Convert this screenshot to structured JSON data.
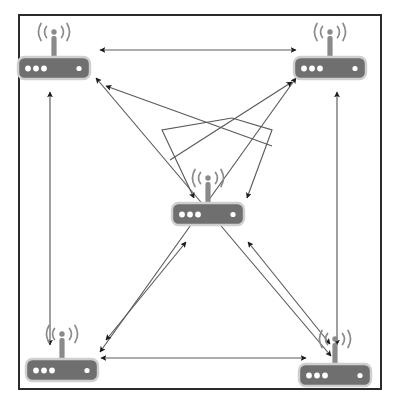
{
  "diagram": {
    "type": "network-topology",
    "canvas": {
      "width": 398,
      "height": 408
    },
    "frame": {
      "name": "coverage-area-boundary",
      "x": 18,
      "y": 14,
      "width": 364,
      "height": 376,
      "stroke": "#2b2b2b",
      "stroke_width": 2,
      "fill": "#ffffff"
    },
    "colors": {
      "device_body": "#6f6f6f",
      "device_outline": "#cfcfcf",
      "device_led": "#ffffff",
      "antenna": "#8a8a8a",
      "link_line": "#5a5a5a",
      "arrowhead": "#1c1c1c",
      "frame_border": "#2b2b2b",
      "background": "#ffffff"
    },
    "node_count": 5,
    "link_count": 12
  },
  "nodes": [
    {
      "id": "router-top-left",
      "label": "Wireless Router",
      "position_label": "top-left",
      "icon": "wireless-router-icon",
      "x": 54,
      "y": 68,
      "body_width": 72,
      "body_height": 22,
      "led_count_left": 3,
      "led_count_right": 1
    },
    {
      "id": "router-top-right",
      "label": "Wireless Router",
      "position_label": "top-right",
      "icon": "wireless-router-icon",
      "x": 330,
      "y": 68,
      "body_width": 72,
      "body_height": 22,
      "led_count_left": 3,
      "led_count_right": 1
    },
    {
      "id": "router-center",
      "label": "Wireless Router",
      "position_label": "center",
      "icon": "wireless-router-icon",
      "x": 208,
      "y": 214,
      "body_width": 72,
      "body_height": 22,
      "led_count_left": 3,
      "led_count_right": 1
    },
    {
      "id": "router-bottom-left",
      "label": "Wireless Router",
      "position_label": "bottom-left",
      "icon": "wireless-router-icon",
      "x": 62,
      "y": 370,
      "body_width": 72,
      "body_height": 22,
      "led_count_left": 3,
      "led_count_right": 1
    },
    {
      "id": "router-bottom-right",
      "label": "Wireless Router",
      "position_label": "bottom-right",
      "icon": "wireless-router-icon",
      "x": 335,
      "y": 375,
      "body_width": 72,
      "body_height": 22,
      "led_count_left": 3,
      "led_count_right": 1
    }
  ],
  "links": [
    {
      "id": "link-top-edge",
      "from": "router-top-left",
      "to": "router-top-right",
      "direction": "bidirectional",
      "shape": "straight",
      "points": "100,50 296,50"
    },
    {
      "id": "link-left-edge",
      "from": "router-top-left",
      "to": "router-bottom-left",
      "direction": "bidirectional",
      "shape": "straight",
      "points": "50,92 50,345"
    },
    {
      "id": "link-right-edge",
      "from": "router-top-right",
      "to": "router-bottom-right",
      "direction": "bidirectional",
      "shape": "straight",
      "points": "337,92 337,345"
    },
    {
      "id": "link-bottom-edge",
      "from": "router-bottom-left",
      "to": "router-bottom-right",
      "direction": "bidirectional",
      "shape": "straight",
      "points": "101,358 306,358"
    },
    {
      "id": "link-diagonal-tl-br",
      "from": "router-top-left",
      "to": "router-bottom-right",
      "direction": "bidirectional",
      "shape": "straight",
      "points": "96,78 331,356"
    },
    {
      "id": "link-diagonal-tr-bl",
      "from": "router-top-right",
      "to": "router-bottom-left",
      "direction": "bidirectional",
      "shape": "straight",
      "points": "296,78 100,352"
    },
    {
      "id": "link-arch-tl-center",
      "from": "router-top-left",
      "to": "router-center",
      "direction": "unidirectional",
      "shape": "polyline-arch",
      "points": "232,118 162,130 194,198"
    },
    {
      "id": "link-arch-tr-center",
      "from": "router-top-right",
      "to": "router-center",
      "direction": "unidirectional",
      "shape": "polyline-arch",
      "points": "232,118 272,130 247,198"
    },
    {
      "id": "link-center-to-tl",
      "from": "router-center",
      "to": "router-top-left",
      "direction": "unidirectional",
      "shape": "straight",
      "points": "272,146 106,86"
    },
    {
      "id": "link-center-to-tr",
      "from": "router-center",
      "to": "router-top-right",
      "direction": "unidirectional",
      "shape": "straight",
      "points": "170,160 292,82"
    },
    {
      "id": "link-bl-center",
      "from": "router-bottom-left",
      "to": "router-center",
      "direction": "bidirectional",
      "shape": "straight",
      "points": "186,242 106,340"
    },
    {
      "id": "link-br-center",
      "from": "router-bottom-right",
      "to": "router-center",
      "direction": "bidirectional",
      "shape": "straight",
      "points": "248,242 330,344"
    }
  ]
}
